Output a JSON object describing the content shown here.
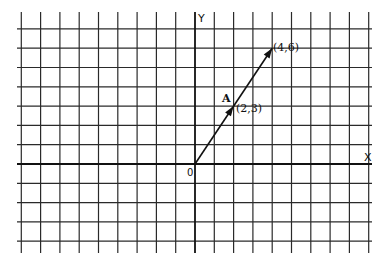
{
  "diagram": {
    "type": "coordinate-grid-vector",
    "axes": {
      "x_label": "X",
      "y_label": "Y",
      "origin_label": "0"
    },
    "grid": {
      "unit_px": 19.3,
      "origin_px": [
        195,
        164
      ],
      "x_range": [
        -9,
        9
      ],
      "y_range": [
        -4,
        7
      ]
    },
    "vector": {
      "name": "A",
      "from": [
        0,
        0
      ],
      "to": [
        4,
        6
      ],
      "midpoint": [
        2,
        3
      ],
      "midpoint_label": "(2,3)",
      "endpoint_label": "(4,6)"
    },
    "colors": {
      "line": "#111111",
      "grid": "#2a2a2a",
      "background": "#ffffff"
    }
  }
}
